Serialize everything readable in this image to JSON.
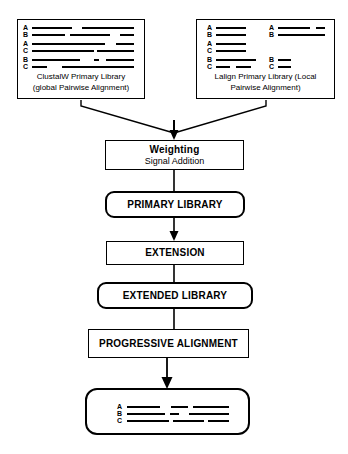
{
  "diagram": {
    "type": "flowchart",
    "colors": {
      "stroke": "#000000",
      "background": "#ffffff",
      "segment": "#000000"
    }
  },
  "sources": {
    "clustalw": {
      "caption_line1": "ClustalW Primary Library",
      "caption_line2": "(global Pairwise Alignment)",
      "pairs": [
        {
          "labels": [
            "A",
            "B"
          ],
          "rows": [
            {
              "label": "A",
              "segments": [
                {
                  "x": 0,
                  "w": 40
                },
                {
                  "x": 50,
                  "w": 52
                }
              ]
            },
            {
              "label": "B",
              "segments": [
                {
                  "x": 0,
                  "w": 33
                },
                {
                  "x": 38,
                  "w": 40
                },
                {
                  "x": 88,
                  "w": 14
                }
              ]
            }
          ]
        },
        {
          "labels": [
            "A",
            "C"
          ],
          "rows": [
            {
              "label": "A",
              "segments": [
                {
                  "x": 0,
                  "w": 73
                },
                {
                  "x": 84,
                  "w": 18
                }
              ]
            },
            {
              "label": "C",
              "segments": [
                {
                  "x": 0,
                  "w": 62
                },
                {
                  "x": 65,
                  "w": 37
                }
              ]
            }
          ]
        },
        {
          "labels": [
            "B",
            "C"
          ],
          "rows": [
            {
              "label": "B",
              "segments": [
                {
                  "x": 0,
                  "w": 48
                },
                {
                  "x": 62,
                  "w": 5
                },
                {
                  "x": 74,
                  "w": 28
                }
              ]
            },
            {
              "label": "C",
              "segments": [
                {
                  "x": 0,
                  "w": 15
                },
                {
                  "x": 30,
                  "w": 72
                }
              ]
            }
          ]
        }
      ]
    },
    "lalign": {
      "caption_line1": "Lalign Primary Library (Local",
      "caption_line2": "Pairwise Alignment)",
      "pairs": [
        {
          "labels": [
            "A",
            "B"
          ],
          "rows": [
            {
              "label": "A",
              "segments": [
                {
                  "x": 0,
                  "w": 30
                }
              ]
            },
            {
              "label": "B",
              "segments": [
                {
                  "x": 0,
                  "w": 30
                }
              ]
            }
          ],
          "rows2": [
            {
              "label": "A",
              "segments": [
                {
                  "x": 0,
                  "w": 32
                },
                {
                  "x": 38,
                  "w": 9
                }
              ]
            },
            {
              "label": "B",
              "segments": [
                {
                  "x": 0,
                  "w": 47
                }
              ]
            }
          ]
        },
        {
          "labels": [
            "A",
            "C"
          ],
          "rows": [
            {
              "label": "A",
              "segments": [
                {
                  "x": 0,
                  "w": 30
                }
              ]
            },
            {
              "label": "C",
              "segments": [
                {
                  "x": 0,
                  "w": 30
                }
              ]
            }
          ],
          "rows2": []
        },
        {
          "labels": [
            "B",
            "C"
          ],
          "rows": [
            {
              "label": "B",
              "segments": [
                {
                  "x": 0,
                  "w": 40
                }
              ]
            },
            {
              "label": "C",
              "segments": [
                {
                  "x": 0,
                  "w": 14
                },
                {
                  "x": 20,
                  "w": 15
                }
              ]
            }
          ],
          "rows2": [
            {
              "label": "B",
              "segments": [
                {
                  "x": 0,
                  "w": 13
                }
              ]
            },
            {
              "label": "C",
              "segments": [
                {
                  "x": 0,
                  "w": 13
                }
              ]
            }
          ]
        }
      ]
    }
  },
  "steps": {
    "weighting": {
      "title": "Weighting",
      "subtitle": "Signal Addition"
    },
    "primary_library": {
      "title": "PRIMARY LIBRARY"
    },
    "extension": {
      "title": "EXTENSION"
    },
    "extended_library": {
      "title": "EXTENDED LIBRARY"
    },
    "progressive_alignment": {
      "title": "PROGRESSIVE ALIGNMENT"
    }
  },
  "final_alignment": {
    "rows": [
      {
        "label": "A",
        "segments": [
          {
            "x": 0,
            "w": 33
          },
          {
            "x": 44,
            "w": 17
          },
          {
            "x": 66,
            "w": 36
          }
        ]
      },
      {
        "label": "B",
        "segments": [
          {
            "x": 0,
            "w": 38
          },
          {
            "x": 43,
            "w": 9
          },
          {
            "x": 62,
            "w": 40
          }
        ]
      },
      {
        "label": "C",
        "segments": [
          {
            "x": 0,
            "w": 42
          },
          {
            "x": 46,
            "w": 31
          },
          {
            "x": 81,
            "w": 21
          }
        ]
      }
    ]
  }
}
